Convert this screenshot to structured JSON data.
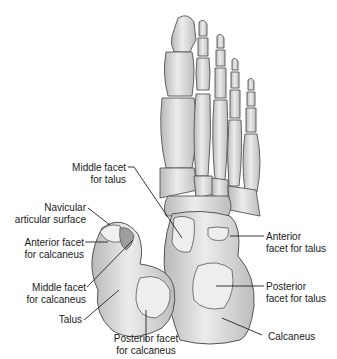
{
  "figure": {
    "colors": {
      "bone_fill": "#d9d9d9",
      "bone_light": "#ececec",
      "bone_dark": "#a8a8a8",
      "outline": "#555555",
      "leader": "#222222",
      "text": "#1a1a1a"
    }
  },
  "labels": [
    {
      "id": "middle-facet-talus",
      "line1": "Middle facet",
      "line2": "for talus"
    },
    {
      "id": "navicular-surface",
      "line1": "Navicular",
      "line2": "articular surface"
    },
    {
      "id": "anterior-facet-calcaneus",
      "line1": "Anterior facet",
      "line2": "for calcaneus"
    },
    {
      "id": "middle-facet-calcaneus",
      "line1": "Middle facet",
      "line2": "for calcaneus"
    },
    {
      "id": "talus",
      "line1": "Talus",
      "line2": ""
    },
    {
      "id": "posterior-facet-calcaneus",
      "line1": "Posterior facet",
      "line2": "for calcaneus"
    },
    {
      "id": "anterior-facet-talus",
      "line1": "Anterior",
      "line2": "facet for talus"
    },
    {
      "id": "posterior-facet-talus",
      "line1": "Posterior",
      "line2": "facet for talus"
    },
    {
      "id": "calcaneus",
      "line1": "Calcaneus",
      "line2": ""
    }
  ]
}
